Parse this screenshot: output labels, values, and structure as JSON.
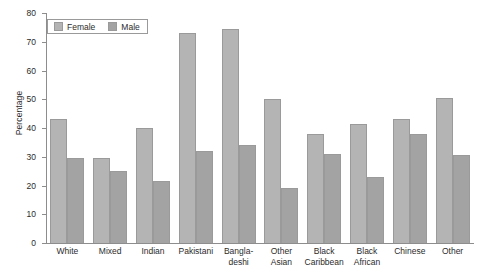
{
  "chart_data": {
    "type": "bar",
    "title": "",
    "subtitle": "",
    "xlabel": "",
    "ylabel": "Percentage",
    "ylim": [
      0,
      80
    ],
    "yticks": [
      0,
      10,
      20,
      30,
      40,
      50,
      60,
      70,
      80
    ],
    "grid": false,
    "legend_position": "top-left",
    "categories": [
      "White",
      "Mixed",
      "Indian",
      "Pakistani",
      "Bangla-\ndeshi",
      "Other\nAsian",
      "Black\nCaribbean",
      "Black\nAfrican",
      "Chinese",
      "Other"
    ],
    "series": [
      {
        "name": "Female",
        "color": "#b4b4b4",
        "values": [
          43,
          29.5,
          40,
          73,
          74.5,
          50,
          38,
          41.5,
          43,
          50.5
        ]
      },
      {
        "name": "Male",
        "color": "#a3a3a3",
        "values": [
          29.5,
          25,
          21.5,
          32,
          34,
          19,
          31,
          23,
          38,
          30.5
        ]
      }
    ]
  },
  "legend": {
    "items": [
      {
        "label": "Female"
      },
      {
        "label": "Male"
      }
    ]
  }
}
